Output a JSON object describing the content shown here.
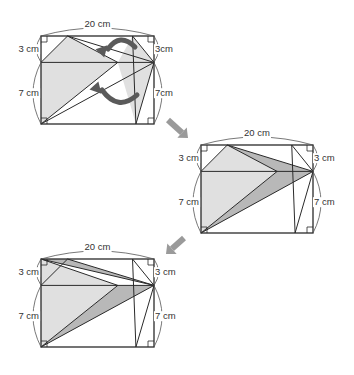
{
  "colors": {
    "line": "#2a2a2a",
    "light_fill": "#e0e0e0",
    "dark_fill": "#b8b8b8",
    "arrow_fill": "#5a5a5a",
    "step_arrow_fill": "#9a9a9a",
    "arc": "#555555"
  },
  "geometry_cm": {
    "width": 20,
    "height": 10,
    "midline_y": 7,
    "points": {
      "A": [
        0,
        0
      ],
      "B": [
        20,
        0
      ],
      "C": [
        20,
        10
      ],
      "D": [
        0,
        10
      ],
      "L": [
        0,
        7
      ],
      "R": [
        20,
        7
      ],
      "P": [
        4.7,
        10
      ],
      "Q": [
        16.2,
        10
      ],
      "M": [
        13.6,
        7
      ],
      "S": [
        16.8,
        0
      ]
    }
  },
  "figures": [
    {
      "name": "figure-1",
      "origin_px": [
        41,
        124
      ],
      "scale_px_per_cm": [
        5.65,
        8.8
      ],
      "labels": {
        "top": "20 cm",
        "left_upper": "3 cm",
        "left_lower": "7 cm",
        "right_upper": "3cm",
        "right_lower": "7cm"
      },
      "fills": [
        {
          "pts": [
            "L",
            "P",
            "M"
          ],
          "tone": "light"
        },
        {
          "pts": [
            "L",
            "M",
            "A"
          ],
          "tone": "light"
        },
        {
          "pts": [
            "Q",
            "R",
            "S",
            "M"
          ],
          "tone": "light"
        }
      ],
      "segments": [
        [
          "L",
          "P"
        ],
        [
          "P",
          "R"
        ],
        [
          "P",
          "M"
        ],
        [
          "L",
          "R"
        ],
        [
          "A",
          "R"
        ],
        [
          "A",
          "M"
        ],
        [
          "Q",
          "S"
        ],
        [
          "Q",
          "R"
        ],
        [
          "R",
          "S"
        ]
      ],
      "curved_arrows": [
        {
          "from": [
            135,
            47
          ],
          "ctrl": [
            120,
            32
          ],
          "to": [
            104,
            49
          ],
          "name": "fold-arrow-upper"
        },
        {
          "from": [
            137,
            95
          ],
          "ctrl": [
            118,
            112
          ],
          "to": [
            98,
            90
          ],
          "name": "fold-arrow-lower"
        }
      ]
    },
    {
      "name": "figure-2",
      "origin_px": [
        201,
        233
      ],
      "scale_px_per_cm": [
        5.6,
        8.8
      ],
      "labels": {
        "top": "20 cm",
        "left_upper": "3 cm",
        "left_lower": "7 cm",
        "right_upper": "3 cm",
        "right_lower": "7 cm"
      },
      "fills": [
        {
          "pts": [
            "L",
            "P",
            "M"
          ],
          "tone": "light"
        },
        {
          "pts": [
            "L",
            "M",
            "A"
          ],
          "tone": "light"
        },
        {
          "pts": [
            "P",
            "R",
            "M"
          ],
          "tone": "dark"
        },
        {
          "pts": [
            "A",
            "M",
            "R"
          ],
          "tone": "dark"
        }
      ],
      "segments": [
        [
          "L",
          "P"
        ],
        [
          "P",
          "R"
        ],
        [
          "P",
          "M"
        ],
        [
          "L",
          "R"
        ],
        [
          "A",
          "R"
        ],
        [
          "A",
          "M"
        ],
        [
          "Q",
          "S"
        ],
        [
          "Q",
          "R"
        ],
        [
          "R",
          "S"
        ]
      ],
      "curved_arrows": []
    },
    {
      "name": "figure-3",
      "origin_px": [
        41,
        347
      ],
      "scale_px_per_cm": [
        5.65,
        8.8
      ],
      "labels": {
        "top": "20 cm",
        "left_upper": "3 cm",
        "left_lower": "7 cm",
        "right_upper": "3 cm",
        "right_lower": "7 cm"
      },
      "fills": [
        {
          "pts": [
            "L",
            "D",
            "M"
          ],
          "tone": "light"
        },
        {
          "pts": [
            "L",
            "M",
            "A"
          ],
          "tone": "light"
        },
        {
          "pts": [
            "D",
            "P",
            "R"
          ],
          "tone": "dark"
        },
        {
          "pts": [
            "A",
            "M",
            "R"
          ],
          "tone": "dark"
        }
      ],
      "segments": [
        [
          "L",
          "P"
        ],
        [
          "D",
          "R"
        ],
        [
          "P",
          "R"
        ],
        [
          "D",
          "M"
        ],
        [
          "L",
          "R"
        ],
        [
          "A",
          "R"
        ],
        [
          "A",
          "M"
        ],
        [
          "Q",
          "S"
        ],
        [
          "Q",
          "R"
        ],
        [
          "R",
          "S"
        ]
      ],
      "curved_arrows": []
    }
  ],
  "step_arrows": [
    {
      "name": "step-arrow-1-to-2",
      "from": [
        168,
        120
      ],
      "to": [
        188,
        138
      ]
    },
    {
      "name": "step-arrow-2-to-3",
      "from": [
        184,
        238
      ],
      "to": [
        166,
        254
      ]
    }
  ]
}
